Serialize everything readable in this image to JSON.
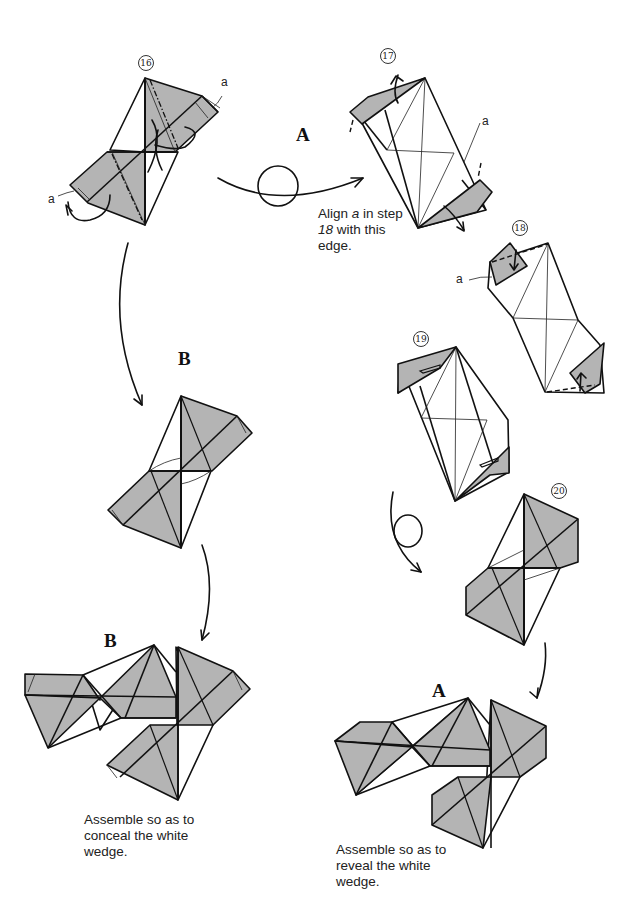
{
  "steps": {
    "s16": "16",
    "s17": "17",
    "s18": "18",
    "s19": "19",
    "s20": "20"
  },
  "point_labels": {
    "a16_top": "a",
    "a16_left": "a",
    "a17": "a",
    "a18": "a"
  },
  "section_labels": {
    "A_top": "A",
    "B_mid": "B",
    "B_bottom": "B",
    "A_bottom": "A"
  },
  "notes": {
    "align_line1_pre": "Align ",
    "align_line1_var": "a",
    "align_line1_post": " in step",
    "align_line2_num": "18",
    "align_line2_post": " with this",
    "align_line3": "edge."
  },
  "captions": {
    "conceal": [
      "Assemble so as to",
      "conceal the white",
      "wedge."
    ],
    "reveal": [
      "Assemble so as to",
      "reveal the white",
      "wedge."
    ]
  },
  "colors": {
    "paper_shade": "#b4b4b4",
    "line": "#111111",
    "background": "#ffffff"
  }
}
